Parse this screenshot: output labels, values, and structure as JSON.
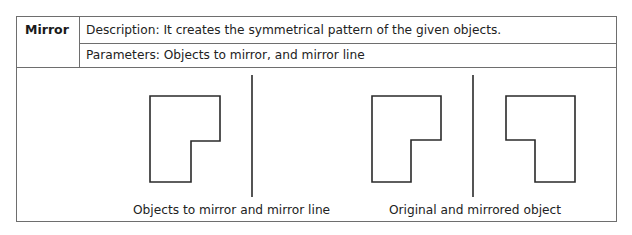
{
  "tool": {
    "name": "Mirror",
    "description": "Description: It creates the symmetrical pattern of the given objects.",
    "parameters": "Parameters: Objects to mirror, and mirror line"
  },
  "figures": [
    {
      "caption": "Objects to mirror and mirror line",
      "objects": [
        "original-object",
        "mirror-line"
      ]
    },
    {
      "caption": "Original and mirrored object",
      "objects": [
        "original-object",
        "mirror-line",
        "mirrored-object"
      ]
    }
  ],
  "colors": {
    "border": "#6e6e6e",
    "stroke": "#2a2a2a",
    "text": "#222222"
  }
}
